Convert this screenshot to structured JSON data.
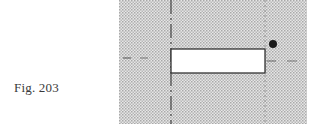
{
  "caption": {
    "label": "Fig. 203"
  },
  "figure": {
    "background": {
      "pattern": "dot-screen",
      "color": "#bdbdbd",
      "bounds": {
        "x": 119,
        "y": 0,
        "width": 188,
        "height": 124
      }
    },
    "rectangle": {
      "fill": "#ffffff",
      "stroke": "#333333",
      "bounds": {
        "x": 171,
        "y": 49,
        "width": 94,
        "height": 24
      }
    },
    "dot": {
      "color": "#1a1a1a",
      "cx": 273,
      "cy": 44,
      "r": 4
    },
    "vertical_lines": [
      {
        "name": "left-axis",
        "x": 171,
        "style": "long-dash",
        "color": "#444444"
      },
      {
        "name": "right-axis",
        "x": 265,
        "style": "dotted",
        "color": "#8a8a8a"
      }
    ],
    "horizontal_lines": [
      {
        "name": "left-center-line",
        "y": 58,
        "segments": [
          [
            123,
            131
          ],
          [
            140,
            148
          ]
        ],
        "color": "#555555"
      },
      {
        "name": "right-center-line",
        "y": 61,
        "segments": [
          [
            267,
            276
          ],
          [
            287,
            297
          ]
        ],
        "color": "#666666"
      }
    ]
  }
}
